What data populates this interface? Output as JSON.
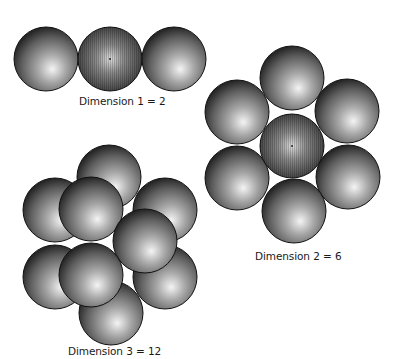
{
  "figure": {
    "panels": [
      {
        "id": "dim1",
        "label": "Dimension 1 = 2",
        "dimension": 1,
        "kissing_number": 2,
        "spheres": [
          {
            "cx": 46,
            "cy": 59,
            "r": 32,
            "role": "neighbor"
          },
          {
            "cx": 110,
            "cy": 59,
            "r": 32,
            "role": "center"
          },
          {
            "cx": 174,
            "cy": 59,
            "r": 32,
            "role": "neighbor"
          }
        ]
      },
      {
        "id": "dim2",
        "label": "Dimension 2 = 6",
        "dimension": 2,
        "kissing_number": 6,
        "spheres": [
          {
            "cx": 292,
            "cy": 78,
            "r": 32,
            "role": "neighbor"
          },
          {
            "cx": 237,
            "cy": 112,
            "r": 32,
            "role": "neighbor"
          },
          {
            "cx": 347,
            "cy": 111,
            "r": 32,
            "role": "neighbor"
          },
          {
            "cx": 237,
            "cy": 178,
            "r": 32,
            "role": "neighbor"
          },
          {
            "cx": 348,
            "cy": 177,
            "r": 32,
            "role": "neighbor"
          },
          {
            "cx": 294,
            "cy": 211,
            "r": 32,
            "role": "neighbor"
          },
          {
            "cx": 292,
            "cy": 146,
            "r": 32,
            "role": "center"
          }
        ]
      },
      {
        "id": "dim3",
        "label": "Dimension 3 = 12",
        "dimension": 3,
        "kissing_number": 12,
        "spheres": [
          {
            "cx": 109,
            "cy": 177,
            "r": 32,
            "role": "back"
          },
          {
            "cx": 55,
            "cy": 210,
            "r": 32,
            "role": "back"
          },
          {
            "cx": 165,
            "cy": 210,
            "r": 32,
            "role": "back"
          },
          {
            "cx": 55,
            "cy": 277,
            "r": 32,
            "role": "back"
          },
          {
            "cx": 165,
            "cy": 277,
            "r": 32,
            "role": "back"
          },
          {
            "cx": 111,
            "cy": 313,
            "r": 32,
            "role": "back"
          },
          {
            "cx": 91,
            "cy": 209,
            "r": 32,
            "role": "front"
          },
          {
            "cx": 145,
            "cy": 241,
            "r": 32,
            "role": "front"
          },
          {
            "cx": 91,
            "cy": 275,
            "r": 32,
            "role": "front"
          }
        ]
      }
    ],
    "colors": {
      "sphere_highlight": "#f2f2f2",
      "sphere_mid": "#8a8a8a",
      "sphere_shadow": "#2b2b2b",
      "outline": "#111111",
      "center_sphere_fill": "#6b6b6b"
    }
  }
}
